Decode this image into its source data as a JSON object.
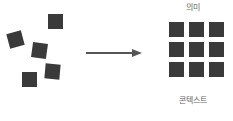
{
  "diagram": {
    "left_squares": [
      {
        "x": 48,
        "y": 14,
        "rot": 0
      },
      {
        "x": 8,
        "y": 32,
        "rot": -15
      },
      {
        "x": 32,
        "y": 43,
        "rot": 8
      },
      {
        "x": 45,
        "y": 64,
        "rot": 5
      },
      {
        "x": 22,
        "y": 72,
        "rot": 0
      }
    ],
    "grid": {
      "rows": 3,
      "cols": 3,
      "x": 169,
      "y": 22,
      "size": 15,
      "gap": 5
    },
    "top_label": "의미",
    "bottom_label": "콘텍스트",
    "colors": {
      "square": "#3a3a3a",
      "arrow": "#555555",
      "label": "#666666"
    }
  }
}
